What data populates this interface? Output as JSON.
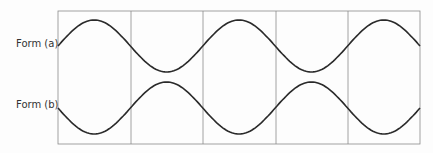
{
  "labels": {
    "form_a": "Form (a)",
    "form_b": "Form (b)"
  },
  "colors": {
    "curve": "#2a2a2a",
    "grid": "#8a8a8a",
    "background": "#fdfdfd"
  },
  "diagram": {
    "type": "waveform-comparison",
    "columns": 5
  }
}
